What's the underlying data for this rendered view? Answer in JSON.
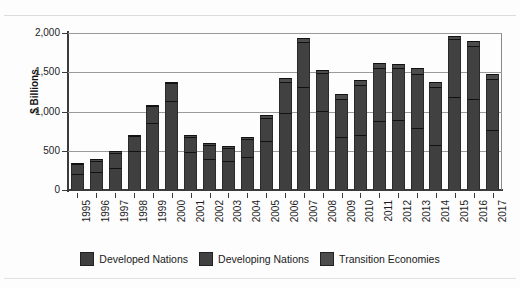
{
  "chart_data": {
    "type": "bar",
    "stacked": true,
    "title": "",
    "subtitle": "",
    "xlabel": "",
    "ylabel": "$ Billions",
    "ylim": [
      0,
      2000
    ],
    "ytick_labels": [
      "0",
      "500",
      "1,000",
      "1,500",
      "2,000"
    ],
    "ytick_values": [
      0,
      500,
      1000,
      1500,
      2000
    ],
    "grid": true,
    "legend_position": "bottom",
    "categories": [
      "1995",
      "1996",
      "1997",
      "1998",
      "1999",
      "2000",
      "2001",
      "2002",
      "2003",
      "2004",
      "2005",
      "2006",
      "2007",
      "2008",
      "2009",
      "2010",
      "2011",
      "2012",
      "2013",
      "2014",
      "2015",
      "2016",
      "2017"
    ],
    "series": [
      {
        "name": "Developed Nations",
        "color": "#3f3f3f",
        "values": [
          205,
          230,
          285,
          500,
          850,
          1130,
          480,
          400,
          370,
          420,
          620,
          980,
          1310,
          1010,
          670,
          700,
          880,
          890,
          790,
          570,
          1180,
          1160,
          760
        ]
      },
      {
        "name": "Developing Nations",
        "color": "#414141",
        "values": [
          130,
          145,
          190,
          185,
          220,
          230,
          190,
          170,
          170,
          230,
          300,
          400,
          570,
          480,
          490,
          640,
          670,
          660,
          690,
          740,
          740,
          680,
          660
        ]
      },
      {
        "name": "Transition Economies",
        "color": "#4c4c4c",
        "values": [
          15,
          20,
          20,
          20,
          15,
          20,
          25,
          30,
          25,
          30,
          40,
          50,
          60,
          40,
          60,
          60,
          70,
          60,
          80,
          60,
          40,
          60,
          60
        ]
      }
    ],
    "totals": [
      350,
      395,
      495,
      705,
      1085,
      1380,
      695,
      600,
      565,
      680,
      960,
      1430,
      1940,
      1530,
      1220,
      1400,
      1620,
      1610,
      1560,
      1370,
      1960,
      1900,
      1480
    ]
  },
  "legend": {
    "items": [
      {
        "label": "Developed Nations"
      },
      {
        "label": "Developing Nations"
      },
      {
        "label": "Transition Economies"
      }
    ]
  },
  "axes": {
    "y_title": "$ Billions"
  }
}
